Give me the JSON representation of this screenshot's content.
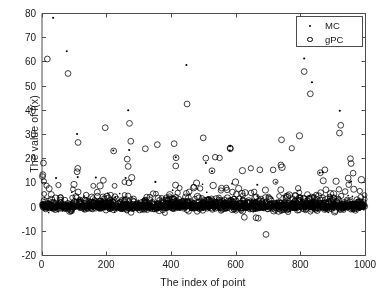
{
  "chart_data": {
    "type": "scatter",
    "title": "",
    "xlabel": "The index of point",
    "ylabel": "The value of f(x)",
    "xlim": [
      0,
      1000
    ],
    "ylim": [
      -20,
      80
    ],
    "xticks": [
      0,
      200,
      400,
      600,
      800,
      1000
    ],
    "yticks": [
      -20,
      -10,
      0,
      10,
      20,
      30,
      40,
      50,
      60,
      70,
      80
    ],
    "grid": false,
    "legend_position": "top-right",
    "legend": [
      {
        "name": "MC",
        "marker": "dot",
        "color": "#000000"
      },
      {
        "name": "gPC",
        "marker": "open-circle",
        "color": "#000000"
      }
    ],
    "series": [
      {
        "name": "MC",
        "marker": "dot",
        "color": "#000000",
        "description": "Monte Carlo samples: dense band of ~1000 points clustered near f(x)=0 (approximately -2 to +4), with sparse positive outliers reaching up to 78.",
        "outliers": [
          {
            "x": 36,
            "y": 78.0
          },
          {
            "x": 78,
            "y": 64.2
          },
          {
            "x": 110,
            "y": 30.0
          },
          {
            "x": 112,
            "y": 12.2
          },
          {
            "x": 222,
            "y": 23.2
          },
          {
            "x": 268,
            "y": 39.8
          },
          {
            "x": 271,
            "y": 23.4
          },
          {
            "x": 448,
            "y": 58.5
          },
          {
            "x": 415,
            "y": 20.4
          },
          {
            "x": 508,
            "y": 18.0
          },
          {
            "x": 527,
            "y": 14.6
          },
          {
            "x": 583,
            "y": 25.0
          },
          {
            "x": 582,
            "y": 23.2
          },
          {
            "x": 812,
            "y": 61.2
          },
          {
            "x": 836,
            "y": 51.4
          },
          {
            "x": 922,
            "y": 39.6
          },
          {
            "x": 45,
            "y": 11.8
          },
          {
            "x": 168,
            "y": 12.0
          },
          {
            "x": 260,
            "y": 11.8
          },
          {
            "x": 352,
            "y": 10.2
          },
          {
            "x": 667,
            "y": 9.0
          },
          {
            "x": 860,
            "y": 14.0
          },
          {
            "x": 869,
            "y": 14.2
          },
          {
            "x": 957,
            "y": 10.4
          }
        ]
      },
      {
        "name": "gPC",
        "marker": "open-circle",
        "color": "#000000",
        "description": "Generalized polynomial chaos surrogate: ~1000 open circles, dense band near f(x)=0 with many moderate positive outliers (5 to 35) and a few large ones reaching 61; a handful of negative outliers down to -11.5.",
        "outliers": [
          {
            "x": 18,
            "y": 61.0
          },
          {
            "x": 82,
            "y": 55.0
          },
          {
            "x": 113,
            "y": 26.5
          },
          {
            "x": 197,
            "y": 32.6
          },
          {
            "x": 223,
            "y": 23.0
          },
          {
            "x": 272,
            "y": 34.4
          },
          {
            "x": 276,
            "y": 27.0
          },
          {
            "x": 321,
            "y": 23.9
          },
          {
            "x": 358,
            "y": 25.6
          },
          {
            "x": 410,
            "y": 26.0
          },
          {
            "x": 450,
            "y": 42.4
          },
          {
            "x": 500,
            "y": 28.4
          },
          {
            "x": 583,
            "y": 24.2
          },
          {
            "x": 584,
            "y": 23.9
          },
          {
            "x": 742,
            "y": 27.6
          },
          {
            "x": 812,
            "y": 55.8
          },
          {
            "x": 831,
            "y": 46.6
          },
          {
            "x": 925,
            "y": 33.6
          },
          {
            "x": 921,
            "y": 30.4
          },
          {
            "x": 6,
            "y": 18.0
          },
          {
            "x": 4,
            "y": 13.2
          },
          {
            "x": 3,
            "y": 12.4
          },
          {
            "x": 112,
            "y": 15.8
          },
          {
            "x": 110,
            "y": 14.4
          },
          {
            "x": 265,
            "y": 19.6
          },
          {
            "x": 268,
            "y": 16.6
          },
          {
            "x": 416,
            "y": 20.2
          },
          {
            "x": 415,
            "y": 16.8
          },
          {
            "x": 508,
            "y": 20.0
          },
          {
            "x": 527,
            "y": 14.8
          },
          {
            "x": 740,
            "y": 17.2
          },
          {
            "x": 675,
            "y": 15.2
          },
          {
            "x": 876,
            "y": 15.2
          },
          {
            "x": 862,
            "y": 14.0
          },
          {
            "x": 955,
            "y": 19.8
          },
          {
            "x": 957,
            "y": 17.8
          },
          {
            "x": 948,
            "y": 11.8
          },
          {
            "x": 627,
            "y": -4.4
          },
          {
            "x": 663,
            "y": -4.6
          },
          {
            "x": 670,
            "y": -4.8
          },
          {
            "x": 694,
            "y": -11.5
          }
        ]
      }
    ]
  },
  "axes": {
    "xtick_labels": [
      "0",
      "200",
      "400",
      "600",
      "800",
      "1000"
    ],
    "ytick_labels": [
      "-20",
      "-10",
      "0",
      "10",
      "20",
      "30",
      "40",
      "50",
      "60",
      "70",
      "80"
    ]
  },
  "legend": {
    "entries": [
      {
        "label": "MC",
        "marker": "dot-marker"
      },
      {
        "label": "gPC",
        "marker": "open-circle-marker"
      }
    ]
  },
  "colors": {
    "axis": "#4d4d4d",
    "marker": "#000000",
    "background": "#ffffff",
    "text": "#1a1a1a"
  }
}
